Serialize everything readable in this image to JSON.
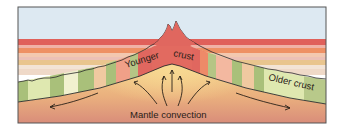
{
  "diagram": {
    "labels": {
      "younger_word1": "Younger",
      "younger_word2": "crust",
      "older": "Older crust",
      "mantle": "Mantle convection"
    },
    "colors": {
      "sky": "#dde9f2",
      "band_red": "#e0605a",
      "band_pink": "#f0b2a6",
      "band_orange": "#ee9064",
      "band_peach": "#f3c8b0",
      "band_tan": "#e9c58e",
      "band_light": "#f3e4d6",
      "crust_green": "#a9c07a",
      "crust_light": "#e6ecc2",
      "crust_red": "#e0675f",
      "mantle_top": "#f3cc86",
      "mantle_bottom": "#d9917b",
      "outline": "#2b2b2b",
      "frame": "#555555"
    }
  }
}
